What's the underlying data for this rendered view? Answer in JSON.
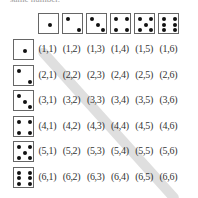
{
  "caption": "same number.",
  "column_header_dice": [
    1,
    2,
    3,
    4,
    5,
    6
  ],
  "row_header_dice": [
    1,
    2,
    3,
    4,
    5,
    6
  ],
  "outcomes": [
    [
      "(1,1)",
      "(1,2)",
      "(1,3)",
      "(1,4)",
      "(1,5)",
      "(1,6)"
    ],
    [
      "(2,1)",
      "(2,2)",
      "(2,3)",
      "(2,4)",
      "(2,5)",
      "(2,6)"
    ],
    [
      "(3,1)",
      "(3,2)",
      "(3,3)",
      "(3,4)",
      "(3,5)",
      "(3,6)"
    ],
    [
      "(4,1)",
      "(4,2)",
      "(4,3)",
      "(4,4)",
      "(4,5)",
      "(4,6)"
    ],
    [
      "(5,1)",
      "(5,2)",
      "(5,3)",
      "(5,4)",
      "(5,5)",
      "(5,6)"
    ],
    [
      "(6,1)",
      "(6,2)",
      "(6,3)",
      "(6,4)",
      "(6,5)",
      "(6,6)"
    ]
  ],
  "highlight": "diagonal (doubles)",
  "colors": {
    "band": "#d9d9d9",
    "pip": "#111111",
    "border": "#666666"
  }
}
